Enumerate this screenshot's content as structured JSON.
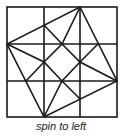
{
  "diagram": {
    "caption": "spin to left",
    "grid": {
      "rows": 3,
      "cols": 3
    },
    "stroke_color": "#1a1a1a"
  }
}
